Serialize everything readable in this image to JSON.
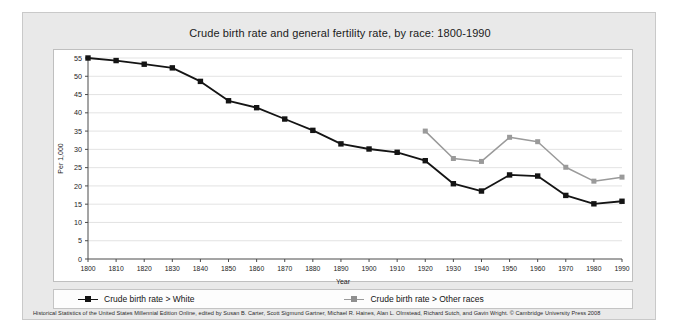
{
  "chart_data": {
    "type": "line",
    "title": "Crude birth rate and general fertility rate, by race: 1800-1990",
    "xlabel": "Year",
    "ylabel": "Per 1,000",
    "grid": true,
    "legend_position": "bottom",
    "xlim": [
      1800,
      1990
    ],
    "ylim": [
      0,
      55
    ],
    "yticks": [
      0,
      5,
      10,
      15,
      20,
      25,
      30,
      35,
      40,
      45,
      50,
      55
    ],
    "categories": [
      1800,
      1810,
      1820,
      1830,
      1840,
      1850,
      1860,
      1870,
      1880,
      1890,
      1900,
      1910,
      1920,
      1930,
      1940,
      1950,
      1960,
      1970,
      1980,
      1990
    ],
    "xtick_labels": [
      "1800",
      "1810",
      "1820",
      "1830",
      "1840",
      "1850",
      "1860",
      "1870",
      "1880",
      "1890",
      "1900",
      "1910",
      "1920",
      "1930",
      "1940",
      "1950",
      "1960",
      "1970",
      "1980",
      "1990"
    ],
    "series": [
      {
        "name": "Crude birth rate > White",
        "color": "#141414",
        "marker": "square",
        "x": [
          1800,
          1810,
          1820,
          1830,
          1840,
          1850,
          1860,
          1870,
          1880,
          1890,
          1900,
          1910,
          1920,
          1930,
          1940,
          1950,
          1960,
          1970,
          1980,
          1990
        ],
        "values": [
          55.0,
          54.3,
          53.3,
          52.3,
          48.6,
          43.3,
          41.4,
          38.3,
          35.2,
          31.5,
          30.1,
          29.2,
          26.9,
          20.6,
          18.6,
          23.0,
          22.7,
          17.4,
          15.1,
          15.8
        ]
      },
      {
        "name": "Crude birth rate > Other races",
        "color": "#9a9a9a",
        "marker": "square",
        "x": [
          1920,
          1930,
          1940,
          1950,
          1960,
          1970,
          1980,
          1990
        ],
        "values": [
          35.0,
          27.5,
          26.7,
          33.3,
          32.1,
          25.1,
          21.3,
          22.4
        ]
      }
    ]
  },
  "legend": {
    "entries": [
      {
        "label": "Crude birth rate > White"
      },
      {
        "label": "Crude birth rate > Other races"
      }
    ]
  },
  "footer": {
    "source": "Historical Statistics of the United States Millennial Edition Online, edited by Susan B. Carter, Scott Sigmund Gartner, Michael R. Haines, Alan L. Olmstead, Richard Sutch, and Gavin Wright. © Cambridge University Press 2008"
  }
}
